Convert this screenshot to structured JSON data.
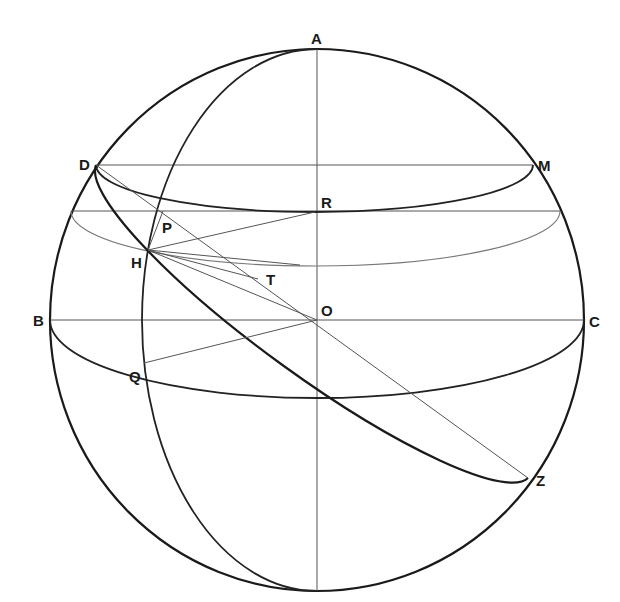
{
  "diagram": {
    "type": "celestial-sphere-geometry",
    "labels": {
      "A": "A",
      "B": "B",
      "C": "C",
      "D": "D",
      "M": "M",
      "R": "R",
      "P": "P",
      "H": "H",
      "T": "T",
      "O": "O",
      "Q": "Q",
      "Z": "Z"
    },
    "points": {
      "A": [
        317,
        49
      ],
      "B": [
        50,
        320
      ],
      "C": [
        584,
        320
      ],
      "D": [
        96,
        165
      ],
      "M": [
        533,
        165
      ],
      "R": [
        315,
        212
      ],
      "P": [
        163,
        211
      ],
      "H": [
        148,
        250
      ],
      "T": [
        258,
        279
      ],
      "O": [
        317,
        320
      ],
      "Q": [
        144,
        363
      ],
      "Z": [
        528,
        478
      ]
    },
    "colors": {
      "stroke": "#1a1a1a",
      "thin_stroke": "#555555",
      "background": "#ffffff"
    }
  }
}
